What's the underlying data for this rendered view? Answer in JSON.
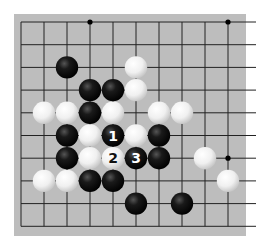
{
  "game": "Go",
  "board": {
    "background": "#bdbdbd",
    "line_color": "#222222",
    "columns": 10,
    "rows": 10,
    "open_edges": [
      "right"
    ]
  },
  "star_points": [
    [
      3,
      0
    ],
    [
      9,
      0
    ],
    [
      9,
      6
    ]
  ],
  "black_stones": [
    {
      "col": 2,
      "row": 2
    },
    {
      "col": 3,
      "row": 3
    },
    {
      "col": 4,
      "row": 3
    },
    {
      "col": 3,
      "row": 4
    },
    {
      "col": 2,
      "row": 5
    },
    {
      "col": 4,
      "row": 5,
      "label": "1"
    },
    {
      "col": 6,
      "row": 5
    },
    {
      "col": 2,
      "row": 6
    },
    {
      "col": 5,
      "row": 6,
      "label": "3"
    },
    {
      "col": 6,
      "row": 6
    },
    {
      "col": 3,
      "row": 7
    },
    {
      "col": 4,
      "row": 7
    },
    {
      "col": 5,
      "row": 8
    },
    {
      "col": 7,
      "row": 8
    }
  ],
  "white_stones": [
    {
      "col": 5,
      "row": 2
    },
    {
      "col": 5,
      "row": 3
    },
    {
      "col": 1,
      "row": 4
    },
    {
      "col": 2,
      "row": 4
    },
    {
      "col": 4,
      "row": 4
    },
    {
      "col": 6,
      "row": 4
    },
    {
      "col": 7,
      "row": 4
    },
    {
      "col": 3,
      "row": 5
    },
    {
      "col": 5,
      "row": 5
    },
    {
      "col": 3,
      "row": 6
    },
    {
      "col": 4,
      "row": 6,
      "label": "2"
    },
    {
      "col": 8,
      "row": 6
    },
    {
      "col": 1,
      "row": 7
    },
    {
      "col": 2,
      "row": 7
    },
    {
      "col": 9,
      "row": 7
    }
  ],
  "colors": {
    "black_stone": "#111111",
    "white_stone": "#f4f4f4",
    "black_label": "#ffffff",
    "white_label": "#111111"
  }
}
